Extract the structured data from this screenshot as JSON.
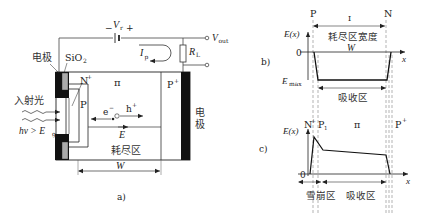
{
  "figure": {
    "panel_a": {
      "label": "a)",
      "battery_label": "V",
      "battery_sub": "r",
      "battery_minus": "−",
      "battery_plus": "+",
      "vout_label": "V",
      "vout_sub": "out",
      "resistor_label": "R",
      "resistor_sub": "L",
      "current_label": "I",
      "current_sub": "p",
      "electrode_left": "电极",
      "sio2_label": "SiO",
      "sio2_sub": "2",
      "n_plus": "N",
      "n_plus_sup": "+",
      "p_region": "P",
      "pi_region": "π",
      "p_plus": "P",
      "p_plus_sup": "+",
      "electrode_right_1": "电",
      "electrode_right_2": "极",
      "incident_light": "入射光",
      "photon_condition": "hν > E",
      "photon_sub": "g",
      "electron": "e",
      "electron_sup": "−",
      "hole": "h",
      "hole_sup": "+",
      "field": "E",
      "depletion": "耗尽区",
      "width": "W"
    },
    "panel_b": {
      "label": "b)",
      "left_marker": "P",
      "right_marker": "N",
      "top_marker": "I",
      "y_axis": "E(x)",
      "zero": "0",
      "emax": "E",
      "emax_sub": "max",
      "x_axis": "x",
      "depletion_width": "耗尽区宽度",
      "width": "W",
      "absorption": "吸收区"
    },
    "panel_c": {
      "label": "c)",
      "n_plus": "N",
      "n_plus_sup": "+",
      "p1": "P",
      "p1_sub": "1",
      "pi": "π",
      "p_plus": "P",
      "p_plus_sup": "+",
      "y_axis": "E(x)",
      "zero": "0",
      "x_axis": "x",
      "avalanche": "雪崩区",
      "absorption": "吸收区"
    }
  }
}
